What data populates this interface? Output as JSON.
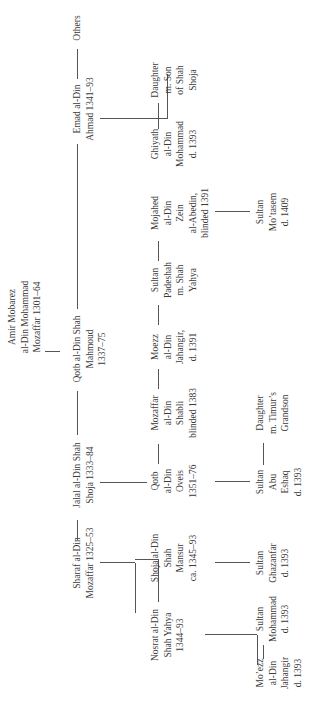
{
  "orientation": "rotated -90deg",
  "generations": {
    "g1": {
      "founder": {
        "lines": [
          "Amir Mobarez",
          "al-Din Mohammad",
          "Mozaffar 1301–64"
        ]
      }
    },
    "g2": [
      {
        "id": "sharaf",
        "lines": [
          "Sharaf al-Din",
          "Mozaffar 1325–53"
        ]
      },
      {
        "id": "jalal",
        "lines": [
          "Jalal al-Din Shah",
          "Shoja 1333–84"
        ]
      },
      {
        "id": "qotb",
        "lines": [
          "Qotb al-Din Shah",
          "Mahmoud",
          "1337–75"
        ]
      },
      {
        "id": "emad",
        "lines": [
          "Emad al-Din",
          "Ahmad 1341–93"
        ]
      },
      {
        "id": "others",
        "lines": [
          "Others"
        ]
      }
    ],
    "g3": [
      {
        "id": "nosrat",
        "parent": "sharaf",
        "lines": [
          "Nosrat al-Din",
          "Shah Yahya",
          "1344–93"
        ]
      },
      {
        "id": "shoja-mansur",
        "parent": "sharaf",
        "lines": [
          "Shoja al-Din",
          "Shah",
          "Mansur",
          "ca. 1345–93"
        ]
      },
      {
        "id": "qotb-oveis",
        "parent": "jalal",
        "lines": [
          "Qotb",
          "al-Din",
          "Oveis",
          "1351–76"
        ]
      },
      {
        "id": "mozaffar-shabli",
        "parent": "jalal",
        "lines": [
          "Mozaffar",
          "al-Din",
          "Shabli",
          "blinded 1383"
        ]
      },
      {
        "id": "moezz",
        "parent": "jalal",
        "lines": [
          "Moezz",
          "al-Din",
          "Jahangir,",
          "d. 1391"
        ]
      },
      {
        "id": "padeshah",
        "parent": "jalal",
        "lines": [
          "Sultan",
          "Padeshah",
          "m. Shah",
          "Yahya"
        ]
      },
      {
        "id": "mojahed",
        "parent": "jalal",
        "lines": [
          "Mojahed",
          "al-Din",
          "Zein",
          "al-Abedin,",
          "blinded 1391"
        ]
      },
      {
        "id": "ghiyath",
        "parent": "emad",
        "lines": [
          "Ghiyath",
          "al-Din",
          "Mohammad",
          "d. 1393"
        ]
      },
      {
        "id": "daughter-emad",
        "parent": "emad",
        "lines": [
          "Daughter",
          "m. Son",
          "of Shah",
          "Shoja"
        ]
      }
    ],
    "g4": [
      {
        "id": "moezz-jahangir",
        "parent": "nosrat",
        "lines": [
          "Mo’ezz",
          "al-Din",
          "Jahangir",
          "d. 1393"
        ]
      },
      {
        "id": "sultan-mohammad",
        "parent": "nosrat",
        "lines": [
          "Sultan",
          "Mohammad",
          "d. 1393"
        ]
      },
      {
        "id": "sultan-ghazanfar",
        "parent": "shoja-mansur",
        "lines": [
          "Sultan",
          "Ghazanfar",
          "d. 1393"
        ]
      },
      {
        "id": "sultan-abu-eshaq",
        "parent": "qotb-oveis",
        "lines": [
          "Sultan",
          "Abu",
          "Eshaq",
          "d. 1393"
        ]
      },
      {
        "id": "daughter-oveis",
        "parent": "qotb-oveis",
        "lines": [
          "Daughter",
          "m. Timur’s",
          "Grandson"
        ]
      },
      {
        "id": "sultan-motasem",
        "parent": "mojahed",
        "lines": [
          "Sultan",
          "Mo’tasem",
          "d. 1409"
        ]
      }
    ]
  },
  "colors": {
    "text": "#3a3a3a",
    "lines": "#555555",
    "background": "#ffffff"
  }
}
